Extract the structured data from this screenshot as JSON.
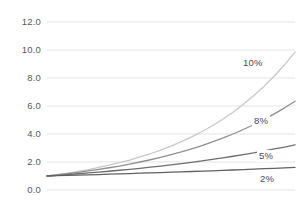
{
  "chart_data": {
    "type": "line",
    "title": "",
    "subtitle": "",
    "xlabel": "",
    "ylabel": "",
    "xlim": [
      0,
      24
    ],
    "ylim": [
      0,
      12
    ],
    "grid": true,
    "grid_axis": "y",
    "legend_position": "inline-right-of-curve",
    "yticks": [
      "0.0",
      "2.0",
      "4.0",
      "6.0",
      "8.0",
      "10.0",
      "12.0"
    ],
    "ytick_values": [
      0,
      2,
      4,
      6,
      8,
      10,
      12
    ],
    "xticks": [],
    "x": [
      0,
      1,
      2,
      3,
      4,
      5,
      6,
      7,
      8,
      9,
      10,
      11,
      12,
      13,
      14,
      15,
      16,
      17,
      18,
      19,
      20,
      21,
      22,
      23,
      24
    ],
    "series": [
      {
        "name": "10%",
        "label": "10%",
        "color": "#c8c8c8",
        "width": 1.3,
        "values": [
          1.0,
          1.1,
          1.21,
          1.33,
          1.46,
          1.61,
          1.77,
          1.95,
          2.14,
          2.36,
          2.59,
          2.85,
          3.14,
          3.45,
          3.8,
          4.18,
          4.59,
          5.05,
          5.56,
          6.12,
          6.73,
          7.4,
          8.14,
          8.95,
          9.85
        ]
      },
      {
        "name": "8%",
        "label": "8%",
        "color": "#8f8f91",
        "width": 1.3,
        "values": [
          1.0,
          1.08,
          1.17,
          1.26,
          1.36,
          1.47,
          1.59,
          1.71,
          1.85,
          2.0,
          2.16,
          2.33,
          2.52,
          2.72,
          2.94,
          3.17,
          3.43,
          3.7,
          4.0,
          4.32,
          4.66,
          5.03,
          5.44,
          5.87,
          6.34
        ]
      },
      {
        "name": "5%",
        "label": "5%",
        "color": "#6e6e70",
        "width": 1.3,
        "values": [
          1.0,
          1.05,
          1.1,
          1.16,
          1.22,
          1.28,
          1.34,
          1.41,
          1.48,
          1.55,
          1.63,
          1.71,
          1.8,
          1.89,
          1.98,
          2.08,
          2.18,
          2.29,
          2.41,
          2.53,
          2.65,
          2.79,
          2.93,
          3.07,
          3.23
        ]
      },
      {
        "name": "2%",
        "label": "2%",
        "color": "#616163",
        "width": 1.3,
        "values": [
          1.0,
          1.02,
          1.04,
          1.06,
          1.08,
          1.1,
          1.13,
          1.15,
          1.17,
          1.2,
          1.22,
          1.24,
          1.27,
          1.29,
          1.32,
          1.35,
          1.37,
          1.4,
          1.43,
          1.46,
          1.49,
          1.52,
          1.55,
          1.58,
          1.61
        ]
      }
    ],
    "series_label_positions": [
      {
        "label": "10%",
        "x_px": 241,
        "y_px": 57
      },
      {
        "label": "8%",
        "x_px": 252,
        "y_px": 115
      },
      {
        "label": "5%",
        "x_px": 257,
        "y_px": 150
      },
      {
        "label": "2%",
        "x_px": 258,
        "y_px": 173
      }
    ],
    "colors": {
      "grid": "#e3e3e3",
      "tick_text": "#59595b",
      "label_text": "#4a4a4c",
      "background": "#ffffff"
    },
    "plot_area_px": {
      "left": 47,
      "right": 295,
      "top": 22,
      "bottom": 190
    }
  }
}
